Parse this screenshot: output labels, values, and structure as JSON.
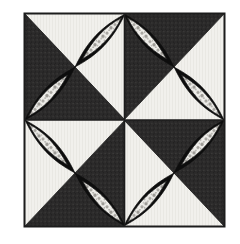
{
  "artwork": {
    "title": "Quilt Block Pattern",
    "type": "patchwork-quilt-block",
    "pattern_name": "Rob Peter to Pay Paul pinwheel variation",
    "canvas": {
      "width": 240,
      "height": 244,
      "background": "#ffffff"
    },
    "block": {
      "x": 24,
      "y": 13,
      "width": 201,
      "height": 214,
      "border_color": "#1c1c1c",
      "border_width": 2,
      "divider_color": "#1c1c1c",
      "divider_width": 2
    },
    "colors": {
      "dark_fabric": "#2b2a2a",
      "light_fabric": "#f1f0ec",
      "lens_black": "#0d0d0d",
      "print_light": "#e8e7e2",
      "print_speckle": "#9a9894",
      "outline": "#141414",
      "page_white": "#ffffff"
    },
    "quadrants": [
      {
        "id": "top-left",
        "name": "quadrant-top-left",
        "col": 0,
        "row": 0,
        "triangles": {
          "north": "light",
          "east": "light",
          "south": "dark",
          "west": "dark"
        },
        "lens_diagonal": "nw-se",
        "lens_count": 2
      },
      {
        "id": "top-right",
        "name": "quadrant-top-right",
        "col": 1,
        "row": 0,
        "triangles": {
          "north": "dark",
          "east": "light",
          "south": "light",
          "west": "dark"
        },
        "lens_diagonal": "ne-sw",
        "lens_count": 2
      },
      {
        "id": "bottom-left",
        "name": "quadrant-bottom-left",
        "col": 0,
        "row": 1,
        "triangles": {
          "north": "light",
          "east": "dark",
          "south": "dark",
          "west": "light"
        },
        "lens_diagonal": "ne-sw",
        "lens_count": 2
      },
      {
        "id": "bottom-right",
        "name": "quadrant-bottom-right",
        "col": 1,
        "row": 1,
        "triangles": {
          "north": "dark",
          "east": "dark",
          "south": "light",
          "west": "light"
        },
        "lens_diagonal": "nw-se",
        "lens_count": 2
      }
    ],
    "lens": {
      "shape": "vesica-piscis",
      "fill": "#0d0d0d",
      "inner_crescent_fill": "print_light",
      "span_fraction_of_diagonal": 0.5,
      "half_width_fraction": 0.17
    }
  }
}
